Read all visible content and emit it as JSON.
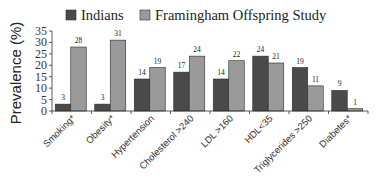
{
  "chart_data": {
    "type": "bar",
    "title": "",
    "xlabel": "",
    "ylabel": "Prevalence (%)",
    "ylim": [
      0,
      35
    ],
    "yticks": [
      0,
      5,
      10,
      15,
      20,
      25,
      30,
      35
    ],
    "grid": false,
    "legend_position": "top",
    "categories": [
      "Smoking*",
      "Obesity*",
      "Hypertension",
      "Cholesterol >240",
      "LDL >160",
      "HDL<35",
      "Triglycerides >250",
      "Diabetes*"
    ],
    "series": [
      {
        "name": "Indians",
        "color": "#4a4a4a",
        "values": [
          3,
          3,
          14,
          17,
          14,
          24,
          19,
          9
        ]
      },
      {
        "name": "Framingham Offspring Study",
        "color": "#9a9a9a",
        "values": [
          28,
          31,
          19,
          24,
          22,
          21,
          11,
          1
        ]
      }
    ]
  }
}
